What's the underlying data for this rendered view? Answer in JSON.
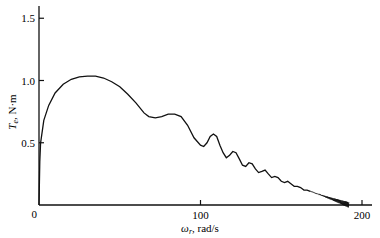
{
  "chart_data": {
    "type": "line",
    "title": "",
    "xlabel": "ω_r, rad/s",
    "ylabel": "T_e, N·m",
    "xlim": [
      0,
      205
    ],
    "ylim": [
      0,
      1.6
    ],
    "x_ticks": [
      0,
      100,
      200
    ],
    "x_tick_labels": [
      "0",
      "100",
      "200"
    ],
    "y_ticks": [
      0,
      0.5,
      1.0,
      1.5
    ],
    "y_tick_labels": [
      "0",
      "0.5",
      "1.0",
      "1.5"
    ],
    "grid": false,
    "legend": null,
    "series": [
      {
        "name": "Electromagnetic torque vs rotor speed (free acceleration)",
        "x": [
          0,
          0.5,
          1,
          3,
          6,
          10,
          15,
          20,
          25,
          30,
          35,
          40,
          45,
          50,
          55,
          60,
          65,
          68,
          72,
          76,
          80,
          84,
          88,
          92,
          96,
          100,
          102,
          104,
          106,
          108,
          110,
          112,
          114,
          116,
          118,
          120,
          122,
          124,
          126,
          128,
          130,
          132,
          134,
          136,
          138,
          140,
          142,
          144,
          146,
          148,
          150,
          152,
          154,
          156,
          158,
          160,
          162,
          164,
          166,
          168,
          170,
          172,
          174,
          176,
          178,
          180,
          182,
          184,
          186,
          188,
          190,
          192
        ],
        "values": [
          0,
          0.35,
          0.5,
          0.68,
          0.8,
          0.9,
          0.97,
          1.01,
          1.03,
          1.035,
          1.035,
          1.02,
          0.99,
          0.95,
          0.89,
          0.82,
          0.74,
          0.71,
          0.7,
          0.71,
          0.73,
          0.73,
          0.71,
          0.64,
          0.54,
          0.48,
          0.47,
          0.5,
          0.55,
          0.57,
          0.55,
          0.48,
          0.42,
          0.38,
          0.4,
          0.43,
          0.42,
          0.37,
          0.32,
          0.31,
          0.34,
          0.33,
          0.29,
          0.26,
          0.27,
          0.28,
          0.25,
          0.22,
          0.23,
          0.22,
          0.19,
          0.18,
          0.19,
          0.17,
          0.15,
          0.15,
          0.14,
          0.12,
          0.12,
          0.11,
          0.09,
          0.09,
          0.08,
          0.07,
          0.06,
          0.06,
          0.05,
          0.04,
          0.03,
          0.02,
          0.01,
          0.0
        ]
      }
    ]
  },
  "colors": {
    "line": "#111111",
    "axis": "#111111",
    "background": "#ffffff"
  }
}
